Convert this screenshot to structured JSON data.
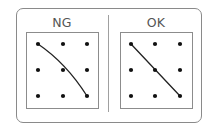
{
  "panels": [
    {
      "id": "ng",
      "label": "NG",
      "grid": {
        "cols_x": [
          38,
          63,
          87
        ],
        "rows_y": [
          44,
          70,
          96
        ]
      },
      "path": {
        "type": "curve",
        "description": "curved line from top-left dot to bottom-right dot, missing center dot",
        "start": [
          38,
          44
        ],
        "control": [
          66,
          63
        ],
        "end": [
          87,
          96
        ]
      }
    },
    {
      "id": "ok",
      "label": "OK",
      "grid": {
        "cols_x": [
          131,
          155,
          180
        ],
        "rows_y": [
          44,
          70,
          96
        ]
      },
      "path": {
        "type": "straight",
        "description": "straight diagonal line from top-left dot through center dot to bottom-right dot",
        "start": [
          131,
          44
        ],
        "end": [
          180,
          96
        ]
      }
    }
  ],
  "colors": {
    "outer_border": "#8a8a8a",
    "panel_border": "#8c8c8c",
    "divider": "#a0a0a0",
    "label": "#555555",
    "dot": "#111111",
    "line": "#222222"
  }
}
